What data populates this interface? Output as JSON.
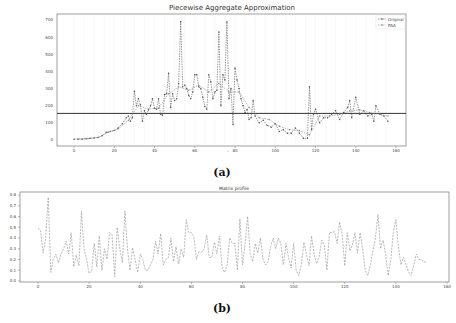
{
  "chart_data": [
    {
      "type": "line",
      "title": "Piecewise Aggregate Approximation",
      "xlabel": "",
      "ylabel": "",
      "xlim": [
        -5,
        162
      ],
      "ylim": [
        -35,
        725
      ],
      "x_ticks": [
        0,
        20,
        40,
        60,
        80,
        100,
        120,
        140,
        160
      ],
      "y_ticks": [
        0,
        100,
        200,
        300,
        400,
        500,
        600,
        700
      ],
      "grid": "vertical dotted lines every ~5 units (PAA segment boundaries)",
      "legend": {
        "position": "upper right",
        "entries": [
          "Original",
          "PAA"
        ]
      },
      "horizontal_line": {
        "y": 155,
        "color": "#333333"
      },
      "series": [
        {
          "name": "Original",
          "style": "dashed line with markers",
          "x": [
            0,
            2,
            4,
            6,
            8,
            10,
            12,
            14,
            16,
            18,
            20,
            22,
            24,
            26,
            27,
            28,
            29,
            30,
            31,
            32,
            33,
            34,
            35,
            36,
            37,
            38,
            39,
            40,
            41,
            42,
            43,
            44,
            45,
            46,
            47,
            48,
            49,
            50,
            51,
            52,
            53,
            54,
            55,
            56,
            57,
            58,
            59,
            60,
            61,
            62,
            63,
            64,
            65,
            66,
            67,
            68,
            69,
            70,
            71,
            72,
            73,
            74,
            75,
            76,
            77,
            78,
            79,
            80,
            81,
            82,
            83,
            84,
            85,
            86,
            87,
            88,
            89,
            90,
            92,
            94,
            96,
            98,
            100,
            102,
            104,
            106,
            108,
            110,
            112,
            114,
            116,
            117,
            118,
            119,
            120,
            122,
            124,
            126,
            128,
            130,
            132,
            134,
            136,
            137,
            138,
            140,
            142,
            144,
            146,
            148,
            149,
            150,
            152,
            154,
            156
          ],
          "values": [
            5,
            5,
            5,
            8,
            10,
            12,
            15,
            25,
            45,
            50,
            55,
            70,
            95,
            130,
            140,
            110,
            130,
            285,
            200,
            240,
            205,
            110,
            170,
            150,
            175,
            200,
            240,
            185,
            180,
            240,
            150,
            145,
            265,
            270,
            390,
            190,
            270,
            230,
            240,
            330,
            690,
            310,
            320,
            300,
            260,
            240,
            280,
            380,
            380,
            310,
            300,
            250,
            195,
            180,
            380,
            340,
            240,
            280,
            290,
            630,
            200,
            380,
            350,
            690,
            240,
            300,
            90,
            420,
            350,
            300,
            240,
            200,
            160,
            180,
            120,
            130,
            230,
            140,
            100,
            115,
            85,
            75,
            95,
            50,
            60,
            40,
            40,
            70,
            40,
            10,
            10,
            310,
            60,
            150,
            180,
            100,
            130,
            130,
            150,
            170,
            120,
            160,
            190,
            230,
            130,
            250,
            150,
            170,
            140,
            150,
            110,
            200,
            150,
            140,
            110
          ]
        },
        {
          "name": "PAA",
          "style": "dashed line with markers",
          "x": [
            2,
            7,
            12,
            17,
            22,
            27,
            32,
            37,
            42,
            47,
            52,
            57,
            62,
            67,
            72,
            77,
            82,
            87,
            92,
            97,
            102,
            107,
            112,
            117,
            122,
            127,
            132,
            137,
            142,
            147,
            152,
            156
          ],
          "values": [
            5,
            8,
            15,
            45,
            65,
            115,
            200,
            180,
            185,
            270,
            310,
            290,
            320,
            280,
            330,
            280,
            280,
            190,
            130,
            120,
            80,
            60,
            55,
            30,
            140,
            140,
            150,
            170,
            175,
            160,
            150,
            140
          ]
        }
      ]
    },
    {
      "type": "line",
      "title": "Matrix profile",
      "xlabel": "",
      "ylabel": "",
      "xlim": [
        -8,
        160
      ],
      "ylim": [
        0.0,
        0.8
      ],
      "x_ticks": [
        0,
        20,
        40,
        60,
        80,
        100,
        120,
        140,
        160
      ],
      "y_ticks": [
        0.0,
        0.1,
        0.2,
        0.3,
        0.4,
        0.5,
        0.6,
        0.7,
        0.8
      ],
      "grid": false,
      "legend": null,
      "series": [
        {
          "name": "Matrix profile",
          "style": "dashed line",
          "x": [
            0,
            1,
            2,
            3,
            4,
            5,
            6,
            7,
            8,
            9,
            10,
            11,
            12,
            13,
            14,
            15,
            16,
            17,
            18,
            19,
            20,
            21,
            22,
            23,
            24,
            25,
            26,
            27,
            28,
            29,
            30,
            31,
            32,
            33,
            34,
            35,
            36,
            37,
            38,
            39,
            40,
            41,
            42,
            43,
            44,
            45,
            46,
            47,
            48,
            49,
            50,
            51,
            52,
            53,
            54,
            55,
            56,
            57,
            58,
            59,
            60,
            61,
            62,
            63,
            64,
            65,
            66,
            67,
            68,
            69,
            70,
            71,
            72,
            73,
            74,
            75,
            76,
            77,
            78,
            79,
            80,
            81,
            82,
            83,
            84,
            85,
            86,
            87,
            88,
            89,
            90,
            91,
            92,
            93,
            94,
            95,
            96,
            97,
            98,
            99,
            100,
            101,
            102,
            103,
            104,
            105,
            106,
            107,
            108,
            109,
            110,
            111,
            112,
            113,
            114,
            115,
            116,
            117,
            118,
            119,
            120,
            121,
            122,
            123,
            124,
            125,
            126,
            127,
            128,
            129,
            130,
            131,
            132,
            133,
            134,
            135,
            136,
            137,
            138,
            139,
            140,
            141,
            142,
            143,
            144,
            145,
            146,
            147,
            148,
            149,
            150,
            151,
            152
          ],
          "values": [
            0.49,
            0.47,
            0.26,
            0.4,
            0.78,
            0.08,
            0.2,
            0.25,
            0.17,
            0.25,
            0.3,
            0.37,
            0.25,
            0.45,
            0.13,
            0.24,
            0.14,
            0.65,
            0.3,
            0.2,
            0.07,
            0.1,
            0.35,
            0.13,
            0.42,
            0.1,
            0.3,
            0.2,
            0.45,
            0.43,
            0.04,
            0.5,
            0.3,
            0.17,
            0.65,
            0.3,
            0.1,
            0.31,
            0.2,
            0.08,
            0.25,
            0.2,
            0.1,
            0.1,
            0.15,
            0.2,
            0.37,
            0.25,
            0.44,
            0.15,
            0.2,
            0.22,
            0.4,
            0.18,
            0.32,
            0.16,
            0.3,
            0.22,
            0.57,
            0.45,
            0.45,
            0.41,
            0.2,
            0.27,
            0.27,
            0.3,
            0.43,
            0.22,
            0.22,
            0.36,
            0.25,
            0.42,
            0.12,
            0.08,
            0.15,
            0.4,
            0.35,
            0.35,
            0.1,
            0.58,
            0.15,
            0.35,
            0.6,
            0.25,
            0.18,
            0.35,
            0.26,
            0.4,
            0.2,
            0.15,
            0.18,
            0.32,
            0.4,
            0.3,
            0.4,
            0.35,
            0.15,
            0.35,
            0.22,
            0.12,
            0.35,
            0.1,
            0.05,
            0.15,
            0.36,
            0.25,
            0.14,
            0.42,
            0.25,
            0.16,
            0.23,
            0.38,
            0.33,
            0.1,
            0.45,
            0.45,
            0.46,
            0.35,
            0.55,
            0.43,
            0.14,
            0.45,
            0.28,
            0.34,
            0.45,
            0.26,
            0.45,
            0.3,
            0.1,
            0.05,
            0.15,
            0.28,
            0.4,
            0.62,
            0.3,
            0.38,
            0.25,
            0.05,
            0.2,
            0.45,
            0.57,
            0.32,
            0.15,
            0.22,
            0.15,
            0.08,
            0.05,
            0.15,
            0.25,
            0.2,
            0.2,
            0.18,
            0.17
          ]
        }
      ]
    }
  ],
  "charts": {
    "a": {
      "title": "Piecewise Aggregate Approximation",
      "caption": "(a)",
      "legend": [
        "Original",
        "PAA"
      ],
      "x_tick_labels": [
        "0",
        "20",
        "40",
        "60",
        "80",
        "100",
        "120",
        "140",
        "160"
      ],
      "y_tick_labels": [
        "0",
        "100",
        "200",
        "300",
        "400",
        "500",
        "600",
        "700"
      ]
    },
    "b": {
      "title": "Matrix profile",
      "caption": "(b)",
      "x_tick_labels": [
        "0",
        "20",
        "40",
        "60",
        "80",
        "100",
        "120",
        "140",
        "160"
      ],
      "y_tick_labels": [
        "0.0",
        "0.1",
        "0.2",
        "0.3",
        "0.4",
        "0.5",
        "0.6",
        "0.7",
        "0.8"
      ]
    }
  },
  "colors": {
    "line": "#555555",
    "paa": "#888888",
    "hline": "#333333",
    "frame": "#777777",
    "grid": "#dddddd",
    "profile": "#999999"
  }
}
